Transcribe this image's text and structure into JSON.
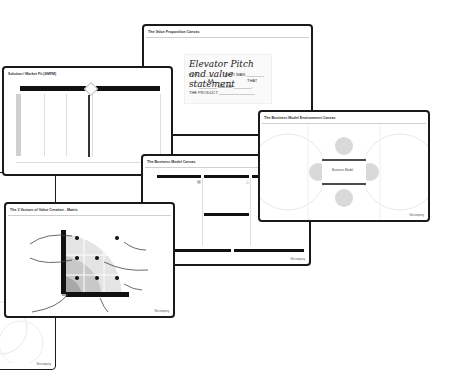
{
  "canvases": {
    "value_proposition": {
      "title": "The Value Proposition Canvas",
      "statement": {
        "heading": "Elevator Pitch and value statement",
        "line1_a": "FOR ________",
        "line1_b": "WHO WAN ________",
        "line2_a": "________ A A ________",
        "line2_b": "THAT",
        "line3": "________ UNLIKE ________,",
        "line4": "THE PRODUCT ________________"
      }
    },
    "solution_market_fit": {
      "title": "Solution / Market Fit (SMFM)"
    },
    "business_model_environment": {
      "title": "The Business Model Environment Canvas",
      "center_label": "Business Model",
      "footer": "Netcompany"
    },
    "business_model": {
      "title": "The Business Model Canvas",
      "footer": "Netcompany"
    },
    "value_creation_matrix": {
      "title": "The 3 Vectors of Value Creation - Matrix",
      "footer": "Netcompany"
    },
    "hidden_card": {
      "footer": "Netcompany"
    }
  },
  "colors": {
    "border": "#1a1a1a",
    "bar": "#111111",
    "grey_light": "#e4e4e4",
    "grey_mid": "#c8c8c8",
    "grey_dark": "#a8a8a8"
  }
}
